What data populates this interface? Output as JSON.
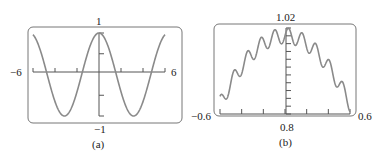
{
  "chart_data": [
    {
      "type": "line",
      "panel": "(a)",
      "function_shape": "cosine",
      "xlim": [
        -6,
        6
      ],
      "ylim": [
        -1,
        1
      ],
      "tick_labels": {
        "left": "−6",
        "right": "6",
        "top": "1",
        "bottom": "−1"
      },
      "x_ticks": [
        -6,
        -4,
        -2,
        0,
        2,
        4,
        6
      ],
      "y_ticks": [
        -1,
        -0.5,
        0,
        0.5,
        1
      ],
      "caption": "(a)",
      "grid": false,
      "legend": null
    },
    {
      "type": "line",
      "panel": "(b)",
      "function_shape": "cosine with small high-frequency oscillation",
      "xlim": [
        -0.6,
        0.6
      ],
      "ylim": [
        0.8,
        1.02
      ],
      "tick_labels": {
        "left": "−0.6",
        "right": "0.6",
        "top": "1.02",
        "bottom": "0.8"
      },
      "x_ticks": [
        -0.6,
        -0.4,
        -0.2,
        0,
        0.2,
        0.4,
        0.6
      ],
      "y_ticks": [
        0.8,
        0.82,
        0.84,
        0.86,
        0.88,
        0.9,
        0.92,
        0.94,
        0.96,
        0.98,
        1.0,
        1.02
      ],
      "caption": "(b)",
      "grid": false,
      "legend": null
    }
  ],
  "panels": {
    "a": {
      "left": "−6",
      "right": "6",
      "top": "1",
      "bottom": "−1",
      "caption": "(a)"
    },
    "b": {
      "left": "−0.6",
      "right": "0.6",
      "top": "1.02",
      "bottom": "0.8",
      "caption": "(b)"
    }
  },
  "colors": {
    "curve": "#8a8a8a",
    "axis": "#555555",
    "frame": "#777777",
    "text": "#222222"
  }
}
